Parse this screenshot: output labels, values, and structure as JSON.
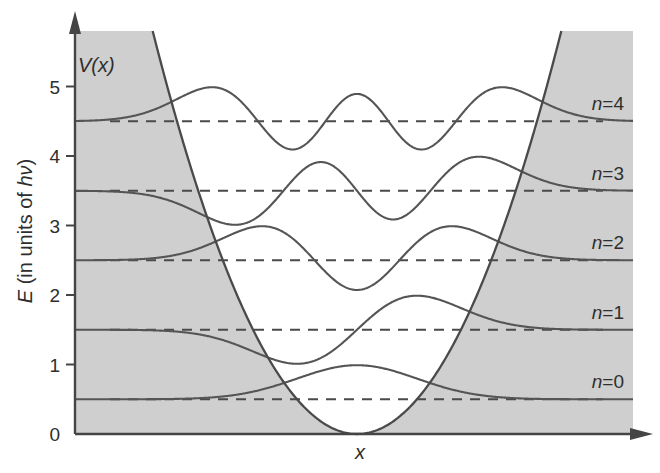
{
  "figure": {
    "potential_label": "V(x)",
    "xlabel": "x",
    "ylabel": "E (in units of hν)",
    "ylabel_parts": [
      {
        "text": "E",
        "italic": true
      },
      {
        "text": " (in units of ",
        "italic": false
      },
      {
        "text": "hν",
        "italic": true
      },
      {
        "text": ")",
        "italic": false
      }
    ]
  },
  "colors": {
    "shading": "#cfcfcf",
    "axis": "#454545",
    "potential": "#4a4a4a",
    "levels": "#4a4a4a",
    "wavefunctions": "#555555",
    "background": "#ffffff"
  },
  "chart_data": {
    "type": "line",
    "title": "",
    "xlabel": "x",
    "ylabel": "E (in units of hν)",
    "ylim": [
      0,
      5.8
    ],
    "yticks": [
      "0",
      "1",
      "2",
      "3",
      "4",
      "5"
    ],
    "ytick_values": [
      0,
      1,
      2,
      3,
      4,
      5
    ],
    "grid": false,
    "legend": null,
    "potential": {
      "name": "V(x)",
      "form": "parabola V = 0.5·x² (harmonic oscillator)",
      "coefficient": 0.5,
      "shaded_outside": true
    },
    "energy_levels": [
      {
        "n": 0,
        "E": 0.5,
        "label": "n=0",
        "label_var": "n",
        "label_num": "=0",
        "style": "dashed"
      },
      {
        "n": 1,
        "E": 1.5,
        "label": "n=1",
        "label_var": "n",
        "label_num": "=1",
        "style": "dashed"
      },
      {
        "n": 2,
        "E": 2.5,
        "label": "n=2",
        "label_var": "n",
        "label_num": "=2",
        "style": "dashed"
      },
      {
        "n": 3,
        "E": 3.5,
        "label": "n=3",
        "label_var": "n",
        "label_num": "=3",
        "style": "dashed"
      },
      {
        "n": 4,
        "E": 4.5,
        "label": "n=4",
        "label_var": "n",
        "label_num": "=4",
        "style": "dashed"
      }
    ],
    "wavefunction_amplitude": 0.49,
    "sample_x": [
      -4,
      -3.5,
      -3,
      -2.5,
      -2,
      -1.5,
      -1,
      -0.5,
      0,
      0.5,
      1,
      1.5,
      2,
      2.5,
      3,
      3.5,
      4
    ],
    "series": [
      {
        "name": "psi_0 (n=0)",
        "baseline": 0.5,
        "values": [
          0.5,
          0.5,
          0.51,
          0.52,
          0.57,
          0.66,
          0.8,
          0.93,
          0.99,
          0.93,
          0.8,
          0.66,
          0.57,
          0.52,
          0.51,
          0.5,
          0.5
        ]
      },
      {
        "name": "psi_1 (n=1)",
        "baseline": 1.5,
        "values": [
          1.5,
          1.49,
          1.47,
          1.41,
          1.28,
          1.11,
          1.01,
          1.14,
          1.5,
          1.86,
          1.99,
          1.89,
          1.72,
          1.59,
          1.53,
          1.51,
          1.5
        ]
      },
      {
        "name": "psi_2 (n=2)",
        "baseline": 2.5,
        "values": [
          2.5,
          2.52,
          2.58,
          2.72,
          2.9,
          2.99,
          2.76,
          2.31,
          2.07,
          2.31,
          2.76,
          2.99,
          2.9,
          2.72,
          2.58,
          2.52,
          2.5
        ]
      },
      {
        "name": "psi_3 (n=3)",
        "baseline": 3.5,
        "values": [
          3.49,
          3.44,
          3.32,
          3.12,
          3.01,
          3.24,
          3.72,
          3.9,
          3.5,
          3.1,
          3.28,
          3.76,
          3.99,
          3.88,
          3.68,
          3.56,
          3.51
        ]
      },
      {
        "name": "psi_4 (n=4)",
        "baseline": 4.5,
        "values": [
          4.54,
          4.63,
          4.82,
          4.98,
          4.84,
          4.34,
          4.1,
          4.53,
          4.89,
          4.53,
          4.1,
          4.34,
          4.84,
          4.98,
          4.82,
          4.63,
          4.54
        ]
      }
    ]
  }
}
